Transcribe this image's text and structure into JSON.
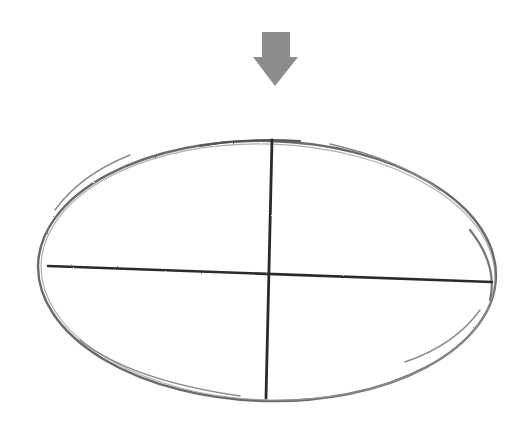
{
  "figure": {
    "background": "#ffffff",
    "arrow": {
      "icon": "arrow-down-icon",
      "color": "#8c8c8c",
      "shaft": {
        "x1": 262,
        "x2": 290,
        "y1": 32,
        "y2": 57
      },
      "head": {
        "x1": 253,
        "x2": 298,
        "y": 57,
        "tip_x": 275,
        "tip_y": 86
      }
    },
    "ellipse": {
      "stroke": "#6e6e6e",
      "cx": 267,
      "cy": 272,
      "rx": 229,
      "ry": 129,
      "rotation_deg": 1.5,
      "left": [
        38,
        268
      ],
      "right": [
        495,
        282
      ],
      "top": [
        272,
        140
      ],
      "bottom": [
        266,
        398
      ]
    },
    "axes": {
      "stroke": "#2a2a2a",
      "horizontal": {
        "x1": 48,
        "y1": 266,
        "x2": 492,
        "y2": 282
      },
      "vertical": {
        "x1": 272,
        "y1": 140,
        "x2": 266,
        "y2": 398
      }
    }
  }
}
